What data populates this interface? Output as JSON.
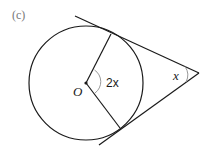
{
  "part_label": "(c)",
  "center_label": "O",
  "center_angle_label": "2x",
  "external_angle_label": "x",
  "colors": {
    "line": "#1a1a1a",
    "part_label": "#777777"
  }
}
